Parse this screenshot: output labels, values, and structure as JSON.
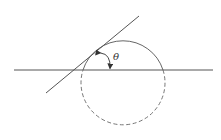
{
  "diagram": {
    "angle_label": "θ",
    "colors": {
      "background": "#ffffff",
      "stroke": "#555555"
    },
    "horizontal_line": {
      "x1": 14,
      "y1": 70,
      "x2": 213,
      "y2": 70
    },
    "tangent_line": {
      "x1": 46,
      "y1": 93,
      "x2": 139,
      "y2": 16
    },
    "circle": {
      "cx": 123,
      "cy": 85,
      "r": 42,
      "upper_arc": "solid",
      "lower_arc": "dashed"
    },
    "angle_arc": {
      "from": "tangent point",
      "to": "horizontal line",
      "arrows": "both ends"
    }
  }
}
